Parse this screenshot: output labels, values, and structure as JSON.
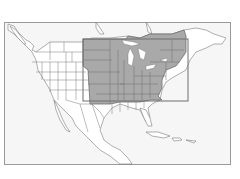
{
  "map": {
    "region": "North America",
    "highlight_label": "",
    "colors": {
      "background": "#f6f6f6",
      "land": "#ffffff",
      "border": "#7a7a7a",
      "highlight_fill": "#a9a9a9",
      "highlight_outline": "#6e6e6e",
      "frame": "#9a9a9a"
    }
  }
}
